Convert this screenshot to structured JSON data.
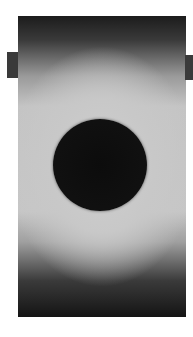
{
  "image": {
    "description": "Grayscale photograph of a dark circular disc centered on a bright field with dark top and bottom edges",
    "subject": "dark-disc",
    "colors": {
      "background": "#ffffff",
      "field_light": "#c8c8c8",
      "edge_dark": "#1c1c1c",
      "disc": "#0c0c0c"
    }
  }
}
